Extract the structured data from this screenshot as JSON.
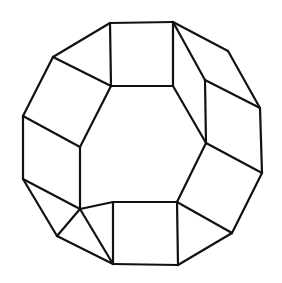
{
  "figure": {
    "stroke_color": "#111111",
    "background": "#ffffff",
    "vertices": {
      "A": [
        110,
        23
      ],
      "B": [
        173,
        22
      ],
      "C": [
        111,
        86
      ],
      "D": [
        173,
        86
      ],
      "E": [
        53,
        57
      ],
      "F": [
        23,
        116
      ],
      "G": [
        23,
        179
      ],
      "H": [
        57,
        236
      ],
      "I": [
        113,
        264
      ],
      "J": [
        178,
        265
      ],
      "K": [
        232,
        233
      ],
      "L": [
        262,
        173
      ],
      "M": [
        260,
        108
      ],
      "N": [
        228,
        51
      ],
      "P": [
        80,
        147
      ],
      "Q": [
        80,
        209
      ],
      "R": [
        113,
        202
      ],
      "S": [
        177,
        202
      ],
      "T": [
        206,
        143
      ],
      "U": [
        205,
        80
      ]
    },
    "edges": [
      [
        "A",
        "B"
      ],
      [
        "A",
        "C"
      ],
      [
        "B",
        "D"
      ],
      [
        "C",
        "D"
      ],
      [
        "A",
        "E"
      ],
      [
        "E",
        "F"
      ],
      [
        "F",
        "G"
      ],
      [
        "G",
        "H"
      ],
      [
        "H",
        "I"
      ],
      [
        "I",
        "J"
      ],
      [
        "J",
        "K"
      ],
      [
        "K",
        "L"
      ],
      [
        "L",
        "M"
      ],
      [
        "M",
        "N"
      ],
      [
        "N",
        "B"
      ],
      [
        "E",
        "C"
      ],
      [
        "C",
        "P"
      ],
      [
        "F",
        "P"
      ],
      [
        "P",
        "Q"
      ],
      [
        "G",
        "Q"
      ],
      [
        "Q",
        "R"
      ],
      [
        "Q",
        "I"
      ],
      [
        "H",
        "Q"
      ],
      [
        "R",
        "I"
      ],
      [
        "R",
        "S"
      ],
      [
        "S",
        "J"
      ],
      [
        "S",
        "K"
      ],
      [
        "S",
        "T"
      ],
      [
        "T",
        "L"
      ],
      [
        "T",
        "U"
      ],
      [
        "U",
        "M"
      ],
      [
        "U",
        "B"
      ],
      [
        "D",
        "T"
      ]
    ]
  }
}
